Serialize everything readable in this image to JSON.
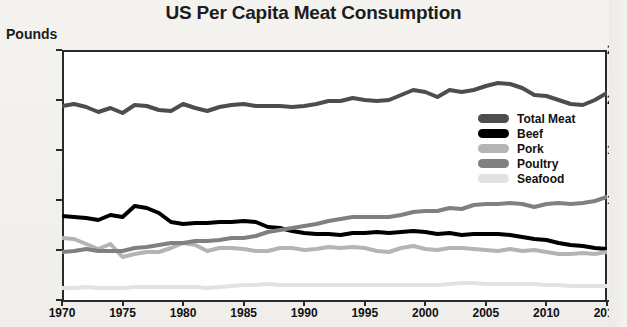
{
  "chart_data": {
    "type": "line",
    "title": "US Per Capita Meat Consumption",
    "xlabel": "",
    "ylabel": "Pounds",
    "xlim": [
      1970,
      2015
    ],
    "ylim": [
      0,
      250
    ],
    "ytick_labels": [
      "250",
      "200",
      "150",
      "100",
      "50",
      "0"
    ],
    "ytick_values": [
      250,
      200,
      150,
      100,
      50,
      0
    ],
    "xtick_labels": [
      "1970",
      "1975",
      "1980",
      "1985",
      "1990",
      "1995",
      "2000",
      "2005",
      "2010",
      "2015"
    ],
    "xtick_values": [
      1970,
      1975,
      1980,
      1985,
      1990,
      1995,
      2000,
      2005,
      2010,
      2015
    ],
    "grid": false,
    "legend_position": "center-right",
    "x": [
      1970,
      1971,
      1972,
      1973,
      1974,
      1975,
      1976,
      1977,
      1978,
      1979,
      1980,
      1981,
      1982,
      1983,
      1984,
      1985,
      1986,
      1987,
      1988,
      1989,
      1990,
      1991,
      1992,
      1993,
      1994,
      1995,
      1996,
      1997,
      1998,
      1999,
      2000,
      2001,
      2002,
      2003,
      2004,
      2005,
      2006,
      2007,
      2008,
      2009,
      2010,
      2011,
      2012,
      2013,
      2014,
      2015
    ],
    "series": [
      {
        "name": "Total Meat",
        "color": "#4d4d4d",
        "values": [
          194,
          196,
          193,
          188,
          192,
          187,
          195,
          194,
          190,
          189,
          196,
          192,
          189,
          193,
          195,
          196,
          194,
          194,
          194,
          193,
          194,
          196,
          199,
          199,
          202,
          200,
          199,
          200,
          205,
          210,
          208,
          203,
          210,
          208,
          210,
          214,
          217,
          216,
          212,
          205,
          204,
          200,
          196,
          195,
          200,
          207
        ]
      },
      {
        "name": "Beef",
        "color": "#000000",
        "values": [
          84,
          83,
          82,
          80,
          85,
          83,
          94,
          92,
          87,
          78,
          76,
          77,
          77,
          78,
          78,
          79,
          78,
          73,
          72,
          69,
          67,
          66,
          66,
          65,
          67,
          67,
          68,
          67,
          68,
          69,
          68,
          66,
          67,
          65,
          66,
          66,
          66,
          65,
          63,
          61,
          60,
          57,
          55,
          54,
          52,
          51
        ]
      },
      {
        "name": "Pork",
        "color": "#b4b4b4",
        "values": [
          62,
          61,
          56,
          51,
          56,
          43,
          46,
          48,
          48,
          52,
          57,
          55,
          49,
          52,
          52,
          51,
          49,
          49,
          52,
          52,
          50,
          51,
          53,
          52,
          53,
          52,
          49,
          48,
          52,
          54,
          51,
          50,
          52,
          52,
          51,
          50,
          49,
          51,
          49,
          50,
          48,
          46,
          46,
          47,
          46,
          48
        ]
      },
      {
        "name": "Poultry",
        "color": "#808080",
        "values": [
          48,
          49,
          51,
          49,
          49,
          49,
          52,
          53,
          55,
          57,
          57,
          59,
          59,
          60,
          62,
          62,
          64,
          68,
          70,
          72,
          74,
          76,
          79,
          81,
          83,
          83,
          83,
          83,
          85,
          88,
          89,
          89,
          92,
          91,
          95,
          96,
          96,
          97,
          96,
          93,
          96,
          97,
          96,
          97,
          99,
          103
        ]
      },
      {
        "name": "Seafood",
        "color": "#e2e2e2",
        "values": [
          12,
          12,
          13,
          12,
          12,
          12,
          13,
          13,
          13,
          13,
          13,
          13,
          12,
          13,
          14,
          15,
          15,
          16,
          15,
          15,
          15,
          15,
          15,
          15,
          15,
          15,
          15,
          15,
          15,
          15,
          15,
          15,
          16,
          17,
          17,
          16,
          16,
          16,
          16,
          16,
          15,
          15,
          14,
          14,
          14,
          14
        ]
      }
    ]
  },
  "legend": {
    "items": [
      {
        "label": "Total Meat",
        "color": "#4d4d4d"
      },
      {
        "label": "Beef",
        "color": "#000000"
      },
      {
        "label": "Pork",
        "color": "#b4b4b4"
      },
      {
        "label": "Poultry",
        "color": "#808080"
      },
      {
        "label": "Seafood",
        "color": "#e2e2e2"
      }
    ]
  }
}
